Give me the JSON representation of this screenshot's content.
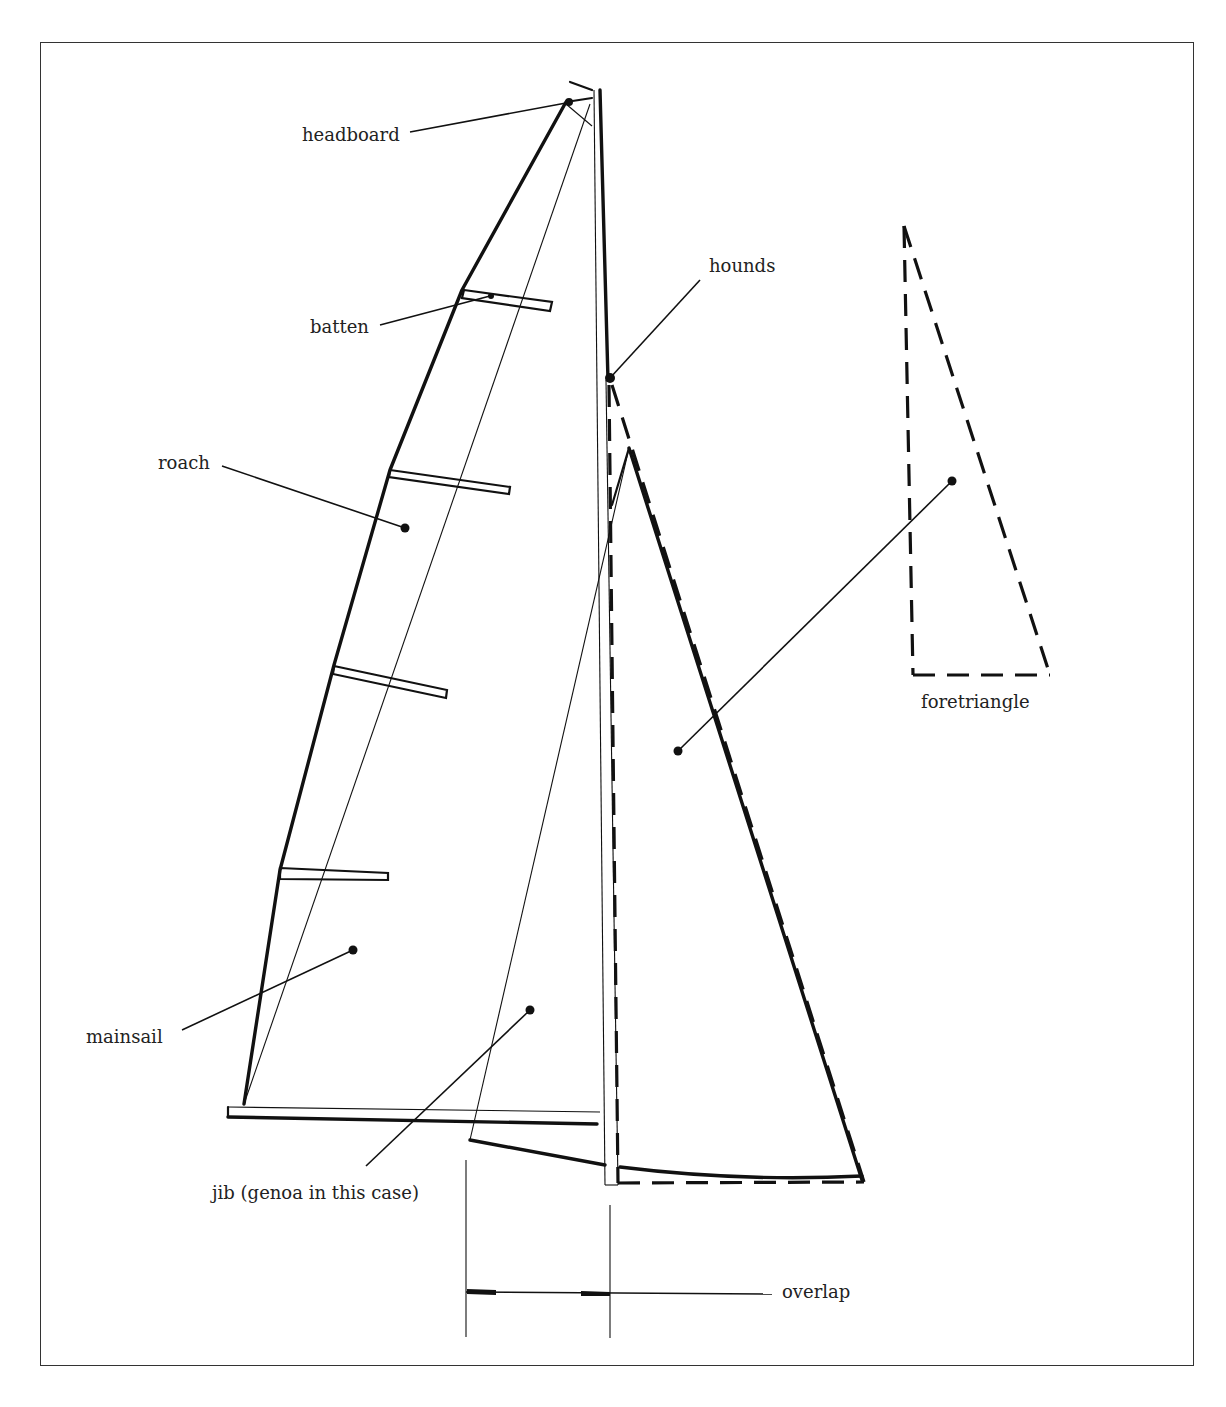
{
  "diagram": {
    "labels": {
      "headboard": "headboard",
      "batten": "batten",
      "hounds": "hounds",
      "roach": "roach",
      "foretriangle": "foretriangle",
      "mainsail": "mainsail",
      "jib": "jib (genoa in this case)",
      "overlap": "overlap"
    },
    "colors": {
      "ink": "#111111",
      "background": "#ffffff",
      "frame": "#333333"
    }
  }
}
